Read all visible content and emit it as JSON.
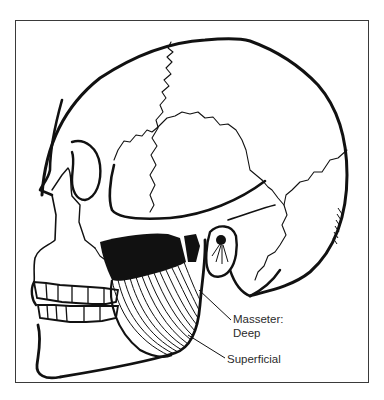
{
  "figure": {
    "labels": {
      "masseter": "Masseter:",
      "deep": "Deep",
      "superficial": "Superficial"
    },
    "colors": {
      "ink": "#111111",
      "label_text": "#2b2b2b",
      "frame": "#3a3a3a",
      "background": "#ffffff"
    }
  }
}
